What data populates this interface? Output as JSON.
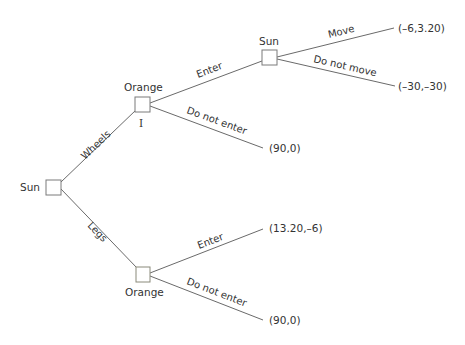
{
  "diagram": {
    "type": "game-tree",
    "nodes": {
      "root": {
        "player": "Sun"
      },
      "upper_orange": {
        "player": "Orange",
        "info_set": "I"
      },
      "upper_sun": {
        "player": "Sun"
      },
      "lower_orange": {
        "player": "Orange"
      }
    },
    "edges": {
      "wheels": "Wheels",
      "legs": "Legs",
      "upper_enter": "Enter",
      "upper_do_not_enter": "Do not enter",
      "move": "Move",
      "do_not_move": "Do not move",
      "lower_enter": "Enter",
      "lower_do_not_enter": "Do not enter"
    },
    "payoffs": {
      "move": "(–6,3.20)",
      "do_not_move": "(–30,–30)",
      "upper_do_not_enter": "(90,0)",
      "lower_enter": "(13.20,–6)",
      "lower_do_not_enter": "(90,0)"
    }
  }
}
